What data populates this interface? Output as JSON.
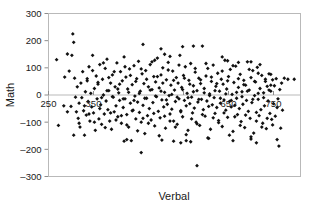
{
  "chart_data": {
    "type": "scatter",
    "title": "",
    "xlabel": "Verbal",
    "ylabel": "Math",
    "xlim": [
      250,
      810
    ],
    "ylim": [
      -300,
      300
    ],
    "grid": false,
    "legend": false,
    "marker": "diamond",
    "marker_color": "#111111",
    "frame_color": "#b9b9b9",
    "xticks": [
      250,
      350,
      450,
      550,
      650,
      750
    ],
    "xtick_labels": [
      "250",
      "350",
      "450",
      "550",
      "650",
      "750"
    ],
    "xtick_labels_visible": [
      "250",
      "350",
      "650",
      "750"
    ],
    "yticks": [
      -300,
      -200,
      -100,
      0,
      100,
      200,
      300
    ],
    "ytick_labels": [
      "–300",
      "–200",
      "–100",
      "0",
      "100",
      "200",
      "300"
    ],
    "xtick_label_position": "at-zero-line",
    "n_points": 420,
    "points": [
      [
        268,
        130
      ],
      [
        272,
        -112
      ],
      [
        286,
        66
      ],
      [
        292,
        151
      ],
      [
        296,
        88
      ],
      [
        300,
        -42
      ],
      [
        302,
        146
      ],
      [
        304,
        225
      ],
      [
        306,
        194
      ],
      [
        308,
        62
      ],
      [
        310,
        -8
      ],
      [
        312,
        -62
      ],
      [
        314,
        30
      ],
      [
        316,
        -86
      ],
      [
        318,
        -30
      ],
      [
        320,
        -118
      ],
      [
        322,
        44
      ],
      [
        324,
        -10
      ],
      [
        326,
        86
      ],
      [
        328,
        -58
      ],
      [
        330,
        -148
      ],
      [
        332,
        12
      ],
      [
        334,
        -74
      ],
      [
        336,
        52
      ],
      [
        338,
        -24
      ],
      [
        340,
        104
      ],
      [
        342,
        -96
      ],
      [
        344,
        6
      ],
      [
        346,
        -44
      ],
      [
        348,
        146
      ],
      [
        350,
        -66
      ],
      [
        352,
        24
      ],
      [
        354,
        -130
      ],
      [
        356,
        70
      ],
      [
        358,
        -14
      ],
      [
        360,
        40
      ],
      [
        362,
        -88
      ],
      [
        364,
        112
      ],
      [
        366,
        -36
      ],
      [
        368,
        -108
      ],
      [
        370,
        58
      ],
      [
        372,
        0
      ],
      [
        374,
        -70
      ],
      [
        376,
        98
      ],
      [
        378,
        -22
      ],
      [
        380,
        132
      ],
      [
        382,
        -54
      ],
      [
        384,
        16
      ],
      [
        386,
        -96
      ],
      [
        388,
        44
      ],
      [
        390,
        -126
      ],
      [
        392,
        74
      ],
      [
        394,
        -8
      ],
      [
        396,
        -62
      ],
      [
        398,
        30
      ],
      [
        400,
        -40
      ],
      [
        402,
        118
      ],
      [
        404,
        -80
      ],
      [
        406,
        8
      ],
      [
        408,
        -20
      ],
      [
        410,
        86
      ],
      [
        412,
        -104
      ],
      [
        414,
        52
      ],
      [
        416,
        -46
      ],
      [
        418,
        140
      ],
      [
        420,
        -14
      ],
      [
        422,
        66
      ],
      [
        424,
        -72
      ],
      [
        426,
        22
      ],
      [
        428,
        -118
      ],
      [
        430,
        96
      ],
      [
        432,
        -30
      ],
      [
        434,
        -168
      ],
      [
        436,
        38
      ],
      [
        438,
        -56
      ],
      [
        440,
        108
      ],
      [
        442,
        -4
      ],
      [
        444,
        -88
      ],
      [
        446,
        60
      ],
      [
        448,
        -26
      ],
      [
        450,
        124
      ],
      [
        452,
        -64
      ],
      [
        454,
        14
      ],
      [
        456,
        -100
      ],
      [
        458,
        78
      ],
      [
        460,
        -38
      ],
      [
        462,
        42
      ],
      [
        464,
        -142
      ],
      [
        466,
        90
      ],
      [
        468,
        -12
      ],
      [
        470,
        -76
      ],
      [
        472,
        30
      ],
      [
        474,
        -50
      ],
      [
        476,
        112
      ],
      [
        478,
        -92
      ],
      [
        480,
        20
      ],
      [
        482,
        -28
      ],
      [
        484,
        68
      ],
      [
        486,
        -114
      ],
      [
        488,
        48
      ],
      [
        490,
        -6
      ],
      [
        492,
        136
      ],
      [
        494,
        -60
      ],
      [
        496,
        26
      ],
      [
        498,
        -84
      ],
      [
        500,
        74
      ],
      [
        502,
        -18
      ],
      [
        504,
        100
      ],
      [
        506,
        -44
      ],
      [
        508,
        10
      ],
      [
        510,
        -122
      ],
      [
        512,
        56
      ],
      [
        514,
        -34
      ],
      [
        516,
        120
      ],
      [
        518,
        -2
      ],
      [
        520,
        -70
      ],
      [
        522,
        36
      ],
      [
        524,
        -52
      ],
      [
        526,
        88
      ],
      [
        528,
        -96
      ],
      [
        530,
        18
      ],
      [
        532,
        -24
      ],
      [
        534,
        64
      ],
      [
        536,
        -108
      ],
      [
        538,
        44
      ],
      [
        540,
        -14
      ],
      [
        542,
        146
      ],
      [
        544,
        -58
      ],
      [
        546,
        28
      ],
      [
        548,
        -80
      ],
      [
        550,
        72
      ],
      [
        552,
        -20
      ],
      [
        554,
        104
      ],
      [
        556,
        -40
      ],
      [
        558,
        6
      ],
      [
        560,
        -130
      ],
      [
        562,
        54
      ],
      [
        564,
        -32
      ],
      [
        566,
        116
      ],
      [
        568,
        -8
      ],
      [
        570,
        -66
      ],
      [
        572,
        34
      ],
      [
        574,
        -48
      ],
      [
        576,
        84
      ],
      [
        578,
        -100
      ],
      [
        580,
        16
      ],
      [
        582,
        -26
      ],
      [
        584,
        62
      ],
      [
        586,
        -112
      ],
      [
        588,
        42
      ],
      [
        590,
        -16
      ],
      [
        592,
        180
      ],
      [
        594,
        -54
      ],
      [
        596,
        24
      ],
      [
        598,
        -78
      ],
      [
        600,
        70
      ],
      [
        602,
        -22
      ],
      [
        604,
        98
      ],
      [
        606,
        -42
      ],
      [
        608,
        4
      ],
      [
        610,
        -126
      ],
      [
        612,
        50
      ],
      [
        614,
        -36
      ],
      [
        616,
        110
      ],
      [
        618,
        -10
      ],
      [
        620,
        -68
      ],
      [
        622,
        32
      ],
      [
        624,
        -46
      ],
      [
        626,
        80
      ],
      [
        628,
        -94
      ],
      [
        630,
        14
      ],
      [
        632,
        -30
      ],
      [
        634,
        58
      ],
      [
        636,
        -116
      ],
      [
        638,
        40
      ],
      [
        640,
        -18
      ],
      [
        642,
        128
      ],
      [
        644,
        -56
      ],
      [
        646,
        22
      ],
      [
        648,
        -82
      ],
      [
        650,
        68
      ],
      [
        652,
        -24
      ],
      [
        654,
        94
      ],
      [
        656,
        -44
      ],
      [
        658,
        2
      ],
      [
        660,
        -134
      ],
      [
        662,
        46
      ],
      [
        664,
        -38
      ],
      [
        666,
        106
      ],
      [
        668,
        -12
      ],
      [
        670,
        -72
      ],
      [
        672,
        28
      ],
      [
        674,
        -50
      ],
      [
        676,
        76
      ],
      [
        678,
        -98
      ],
      [
        680,
        12
      ],
      [
        682,
        -34
      ],
      [
        684,
        54
      ],
      [
        686,
        -120
      ],
      [
        688,
        36
      ],
      [
        690,
        -20
      ],
      [
        692,
        122
      ],
      [
        694,
        -60
      ],
      [
        696,
        18
      ],
      [
        698,
        -86
      ],
      [
        700,
        64
      ],
      [
        702,
        -28
      ],
      [
        704,
        90
      ],
      [
        706,
        -140
      ],
      [
        708,
        -2
      ],
      [
        710,
        48
      ],
      [
        712,
        -64
      ],
      [
        714,
        102
      ],
      [
        716,
        -16
      ],
      [
        718,
        -76
      ],
      [
        720,
        24
      ],
      [
        722,
        -54
      ],
      [
        724,
        72
      ],
      [
        726,
        -104
      ],
      [
        728,
        8
      ],
      [
        730,
        -40
      ],
      [
        732,
        50
      ],
      [
        734,
        -124
      ],
      [
        736,
        32
      ],
      [
        738,
        -22
      ],
      [
        740,
        78
      ],
      [
        742,
        -68
      ],
      [
        744,
        14
      ],
      [
        746,
        -90
      ],
      [
        748,
        56
      ],
      [
        750,
        -32
      ],
      [
        752,
        34
      ],
      [
        754,
        -78
      ],
      [
        756,
        60
      ],
      [
        758,
        -46
      ],
      [
        760,
        -14
      ],
      [
        762,
        -188
      ],
      [
        764,
        20
      ],
      [
        766,
        -122
      ],
      [
        768,
        44
      ],
      [
        770,
        -56
      ],
      [
        774,
        62
      ],
      [
        782,
        58
      ],
      [
        796,
        58
      ],
      [
        330,
        -40
      ],
      [
        340,
        -70
      ],
      [
        352,
        -100
      ],
      [
        364,
        -50
      ],
      [
        376,
        -120
      ],
      [
        388,
        -66
      ],
      [
        400,
        -92
      ],
      [
        412,
        -76
      ],
      [
        424,
        -110
      ],
      [
        436,
        -58
      ],
      [
        448,
        -132
      ],
      [
        460,
        -86
      ],
      [
        472,
        -104
      ],
      [
        484,
        -68
      ],
      [
        496,
        -150
      ],
      [
        508,
        -78
      ],
      [
        520,
        -96
      ],
      [
        532,
        -118
      ],
      [
        544,
        -62
      ],
      [
        556,
        -146
      ],
      [
        568,
        -88
      ],
      [
        580,
        -106
      ],
      [
        592,
        -72
      ],
      [
        604,
        -158
      ],
      [
        616,
        -84
      ],
      [
        628,
        -102
      ],
      [
        640,
        -66
      ],
      [
        652,
        -148
      ],
      [
        664,
        -80
      ],
      [
        676,
        -112
      ],
      [
        688,
        -74
      ],
      [
        700,
        -154
      ],
      [
        712,
        -96
      ],
      [
        724,
        -118
      ],
      [
        736,
        -86
      ],
      [
        748,
        -110
      ],
      [
        336,
        60
      ],
      [
        348,
        90
      ],
      [
        360,
        46
      ],
      [
        372,
        118
      ],
      [
        384,
        64
      ],
      [
        396,
        86
      ],
      [
        408,
        40
      ],
      [
        420,
        104
      ],
      [
        432,
        72
      ],
      [
        444,
        50
      ],
      [
        456,
        96
      ],
      [
        468,
        58
      ],
      [
        480,
        122
      ],
      [
        492,
        68
      ],
      [
        504,
        44
      ],
      [
        516,
        92
      ],
      [
        528,
        54
      ],
      [
        540,
        110
      ],
      [
        552,
        62
      ],
      [
        564,
        40
      ],
      [
        576,
        98
      ],
      [
        588,
        56
      ],
      [
        600,
        116
      ],
      [
        612,
        66
      ],
      [
        624,
        42
      ],
      [
        636,
        88
      ],
      [
        648,
        52
      ],
      [
        660,
        108
      ],
      [
        672,
        60
      ],
      [
        684,
        38
      ],
      [
        696,
        94
      ],
      [
        708,
        50
      ],
      [
        720,
        112
      ],
      [
        732,
        58
      ],
      [
        744,
        36
      ],
      [
        368,
        -10
      ],
      [
        380,
        16
      ],
      [
        392,
        -6
      ],
      [
        404,
        22
      ],
      [
        416,
        -14
      ],
      [
        428,
        10
      ],
      [
        440,
        -20
      ],
      [
        452,
        6
      ],
      [
        464,
        -12
      ],
      [
        476,
        18
      ],
      [
        488,
        -4
      ],
      [
        500,
        14
      ],
      [
        512,
        -18
      ],
      [
        524,
        2
      ],
      [
        536,
        -8
      ],
      [
        548,
        20
      ],
      [
        560,
        -10
      ],
      [
        572,
        12
      ],
      [
        584,
        -16
      ],
      [
        596,
        8
      ],
      [
        608,
        -2
      ],
      [
        620,
        16
      ],
      [
        632,
        -12
      ],
      [
        644,
        4
      ],
      [
        656,
        -20
      ],
      [
        668,
        10
      ],
      [
        680,
        -6
      ],
      [
        692,
        14
      ],
      [
        704,
        -16
      ],
      [
        716,
        6
      ],
      [
        728,
        -10
      ],
      [
        740,
        18
      ],
      [
        418,
        -170
      ],
      [
        424,
        -164
      ],
      [
        456,
        -212
      ],
      [
        502,
        -166
      ],
      [
        528,
        -170
      ],
      [
        544,
        -176
      ],
      [
        556,
        -168
      ],
      [
        566,
        -172
      ],
      [
        580,
        -260
      ],
      [
        606,
        -160
      ],
      [
        660,
        -168
      ],
      [
        700,
        -162
      ],
      [
        712,
        -176
      ],
      [
        758,
        -164
      ],
      [
        306,
        -148
      ],
      [
        318,
        -104
      ],
      [
        292,
        -62
      ],
      [
        284,
        -40
      ],
      [
        460,
        186
      ],
      [
        500,
        170
      ],
      [
        548,
        178
      ],
      [
        572,
        180
      ],
      [
        508,
        150
      ],
      [
        520,
        142
      ],
      [
        486,
        128
      ],
      [
        636,
        140
      ],
      [
        648,
        126
      ],
      [
        672,
        120
      ],
      [
        700,
        122
      ],
      [
        716,
        80
      ],
      [
        744,
        76
      ]
    ]
  }
}
